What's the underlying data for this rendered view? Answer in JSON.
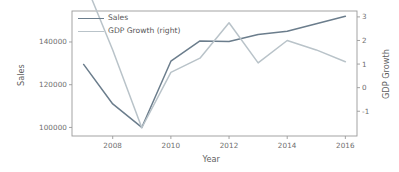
{
  "chart_data": {
    "type": "line",
    "title": "",
    "xlabel": "Year",
    "ylabel": "Sales",
    "y2label": "GDP Growth",
    "x": [
      2007,
      2008,
      2009,
      2010,
      2011,
      2012,
      2013,
      2014,
      2015,
      2016
    ],
    "xlim": [
      2006.6,
      2016.4
    ],
    "xticks": [
      2008,
      2010,
      2012,
      2014,
      2016
    ],
    "xtick_labels": [
      "2008",
      "2010",
      "2012",
      "2014",
      "2016"
    ],
    "ylim": [
      96000,
      154500
    ],
    "yticks": [
      100000,
      120000,
      140000
    ],
    "ytick_labels": [
      "100000",
      "120000",
      "140000"
    ],
    "y2lim": [
      -2.05,
      3.25
    ],
    "y2ticks": [
      -1,
      0,
      1,
      2,
      3
    ],
    "y2tick_labels": [
      "-1",
      "0",
      "1",
      "2",
      "3"
    ],
    "grid": false,
    "legend_position": "upper left",
    "series": [
      {
        "name": "Sales",
        "axis": "left",
        "color": "#6b7d8c",
        "values": [
          129500,
          111000,
          100000,
          131000,
          140500,
          140200,
          143500,
          145000,
          148500,
          152000
        ]
      },
      {
        "name": "GDP Growth (right)",
        "axis": "right",
        "color": "#b9c3c9",
        "values": [
          4.6,
          1.6,
          -1.7,
          0.65,
          1.25,
          2.75,
          1.05,
          2.0,
          1.6,
          1.1
        ]
      }
    ],
    "legend": [
      {
        "label": "Sales",
        "color": "#6b7d8c"
      },
      {
        "label": "GDP Growth (right)",
        "color": "#b9c3c9"
      }
    ]
  },
  "axes": {
    "spine_color": "#9a9a9a",
    "background": "#ffffff"
  }
}
